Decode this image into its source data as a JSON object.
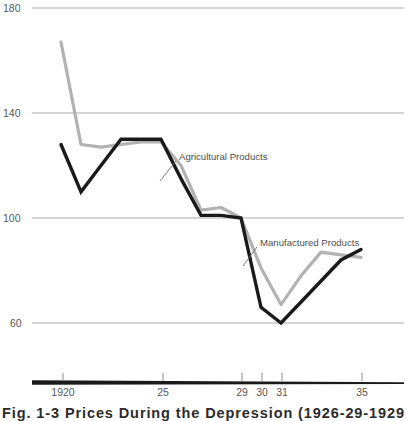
{
  "chart_data": {
    "type": "line",
    "title": "",
    "xlabel": "",
    "ylabel": "",
    "xlim": [
      1919,
      1936
    ],
    "ylim": [
      60,
      180
    ],
    "grid": true,
    "legend_position": "inline-annotations",
    "y_ticks": [
      "180",
      "140",
      "100",
      "60"
    ],
    "y_tick_values": [
      180,
      140,
      100,
      60
    ],
    "x_ticks": [
      "1920",
      "25",
      "29",
      "30",
      "31",
      "35"
    ],
    "x_tick_values": [
      1920,
      1925,
      1929,
      1930,
      1931,
      1935
    ],
    "x": [
      1920,
      1921,
      1922,
      1923,
      1924,
      1925,
      1926,
      1927,
      1928,
      1929,
      1930,
      1931,
      1932,
      1933,
      1934,
      1935
    ],
    "series": [
      {
        "name": "Agricultural Products",
        "color": "#1a1a1a",
        "values": [
          128,
          110,
          120,
          130,
          130,
          130,
          115,
          101,
          101,
          100,
          66,
          60,
          68,
          76,
          84,
          88
        ]
      },
      {
        "name": "Manufactured Products",
        "color": "#b2b2b2",
        "values": [
          167,
          128,
          127,
          128,
          129,
          129,
          120,
          103,
          104,
          100,
          81,
          67,
          78,
          87,
          86,
          85
        ]
      }
    ],
    "annotations": [
      {
        "label": "Agricultural Products",
        "for_series": "Agricultural Products",
        "text_x": 178,
        "text_y": 157,
        "leader_from_x": 176,
        "leader_from_y": 161,
        "leader_to_x": 160,
        "leader_to_y": 181
      },
      {
        "label": "Manufactured Products",
        "for_series": "Manufactured Products",
        "text_x": 259,
        "text_y": 243,
        "leader_from_x": 257,
        "leader_from_y": 247,
        "leader_to_x": 243,
        "leader_to_y": 266
      }
    ]
  },
  "axis": {
    "baseline_color": "#1a1a1a",
    "gridline_color": "#a9a9a9",
    "tick_color": "#8a8a8a"
  },
  "caption": {
    "text": "Fig. 1-3  Prices During the Depression (1926-29-1929 = 100)"
  }
}
